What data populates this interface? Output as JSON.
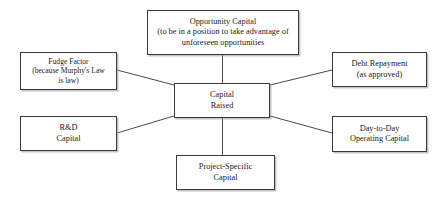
{
  "diagram": {
    "background_color": "#ffffff",
    "box_border_color": "#3a3a3a",
    "box_fill_color": "#ffffff",
    "connector_color": "#4a4a4a",
    "text_color": "#1a1a1a",
    "center": {
      "id": "capital-raised",
      "label": "Capital\nRaised"
    },
    "nodes": [
      {
        "id": "opportunity-capital",
        "label": "Opportunity Capital\n(to be in a position to take advantage of\nunforeseen opportunities",
        "position": "top"
      },
      {
        "id": "fudge-factor",
        "label": "Fudge Factor\n(because Murphy's Law\nis law)",
        "position": "top-left"
      },
      {
        "id": "rd-capital",
        "label": "R&D\nCapital",
        "position": "bottom-left"
      },
      {
        "id": "debt-repayment",
        "label": "Debt Repayment\n(as approved)",
        "position": "top-right"
      },
      {
        "id": "day-to-day-operating-capital",
        "label": "Day-to-Day\nOperating Capital",
        "position": "bottom-right"
      },
      {
        "id": "project-specific-capital",
        "label": "Project-Specific\nCapital",
        "position": "bottom"
      }
    ],
    "connectors": [
      {
        "from": "opportunity-capital",
        "to": "capital-raised"
      },
      {
        "from": "fudge-factor",
        "to": "capital-raised"
      },
      {
        "from": "rd-capital",
        "to": "capital-raised"
      },
      {
        "from": "debt-repayment",
        "to": "capital-raised"
      },
      {
        "from": "day-to-day-operating-capital",
        "to": "capital-raised"
      },
      {
        "from": "project-specific-capital",
        "to": "capital-raised"
      }
    ]
  }
}
